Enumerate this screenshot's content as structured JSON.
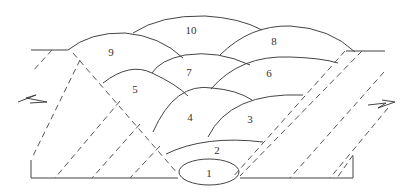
{
  "diagram": {
    "type": "multi-pass weld bead sequence cross-section",
    "colors": {
      "line": "#444444",
      "background": "#ffffff"
    },
    "beads": [
      {
        "id": "1",
        "label": "1"
      },
      {
        "id": "2",
        "label": "2"
      },
      {
        "id": "3",
        "label": "3"
      },
      {
        "id": "4",
        "label": "4"
      },
      {
        "id": "5",
        "label": "5"
      },
      {
        "id": "6",
        "label": "6"
      },
      {
        "id": "7",
        "label": "7"
      },
      {
        "id": "8",
        "label": "8"
      },
      {
        "id": "9",
        "label": "9"
      },
      {
        "id": "10",
        "label": "10"
      }
    ]
  }
}
